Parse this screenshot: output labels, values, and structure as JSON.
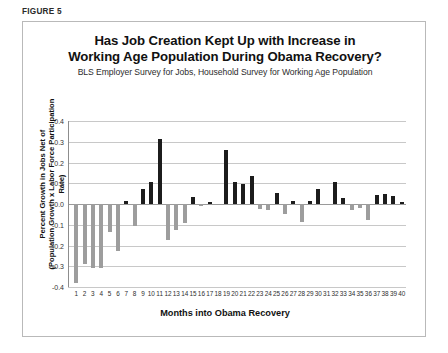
{
  "figure": {
    "label": "FIGURE 5"
  },
  "chart_data": {
    "type": "bar",
    "title_line1": "Has Job Creation Kept Up with Increase in",
    "title_line2": "Working Age Population During Obama Recovery?",
    "subtitle": "BLS Employer Survey for Jobs, Household Survey for Working Age Population",
    "xlabel": "Months into Obama Recovery",
    "ylabel_line1": "Percent Growth in Jobs Net of",
    "ylabel_line2": "(Population Growth x Labor Force Participation Rate)",
    "ylim": [
      -0.4,
      0.4
    ],
    "ytick_labels": [
      "0.4",
      "0.3",
      "0.2",
      "0.1",
      "0.0",
      "-0.1",
      "-0.2",
      "-0.3",
      "-0.4"
    ],
    "ytick_values": [
      0.4,
      0.3,
      0.2,
      0.1,
      0.0,
      -0.1,
      -0.2,
      -0.3,
      -0.4
    ],
    "grid": true,
    "legend": "none",
    "positive_color": "#1c1c1c",
    "negative_color": "#9d9d9d",
    "categories": [
      "1",
      "2",
      "3",
      "4",
      "5",
      "6",
      "7",
      "8",
      "9",
      "10",
      "11",
      "12",
      "13",
      "14",
      "15",
      "16",
      "17",
      "18",
      "19",
      "20",
      "21",
      "22",
      "23",
      "24",
      "25",
      "26",
      "27",
      "28",
      "29",
      "30",
      "31",
      "32",
      "33",
      "34",
      "35",
      "36",
      "37",
      "38",
      "39",
      "40"
    ],
    "values": [
      -0.38,
      -0.29,
      -0.31,
      -0.31,
      -0.135,
      -0.225,
      0.015,
      -0.105,
      0.07,
      0.105,
      0.315,
      -0.175,
      -0.125,
      -0.09,
      0.035,
      -0.012,
      0.01,
      0.0,
      0.26,
      0.105,
      0.095,
      0.135,
      -0.025,
      -0.03,
      0.055,
      -0.05,
      0.015,
      -0.085,
      0.015,
      0.07,
      0.0,
      0.105,
      0.03,
      -0.03,
      -0.018,
      -0.075,
      0.045,
      0.05,
      0.04,
      0.012
    ]
  }
}
